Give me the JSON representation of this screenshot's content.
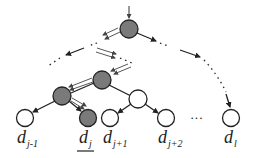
{
  "diagram": {
    "type": "tree-search-path",
    "colors": {
      "visited_node": "#7a7a7a",
      "unvisited_node": "#ffffff",
      "stroke": "#222222",
      "background": "#ffffff"
    },
    "leaves": [
      {
        "id": "d_j-1",
        "base": "d",
        "subscript": "j-1",
        "visited": false,
        "underlined": false
      },
      {
        "id": "d_j",
        "base": "d",
        "subscript": "j",
        "visited": true,
        "underlined": true
      },
      {
        "id": "d_j+1",
        "base": "d",
        "subscript": "j+1",
        "visited": false,
        "underlined": false
      },
      {
        "id": "d_j+2",
        "base": "d",
        "subscript": "j+2",
        "visited": false,
        "underlined": false
      },
      {
        "id": "d_l",
        "base": "d",
        "subscript": "l",
        "visited": false,
        "underlined": false
      }
    ],
    "ellipsis": "···"
  }
}
